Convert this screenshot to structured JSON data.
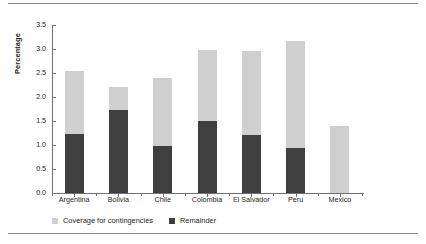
{
  "chart_data": {
    "type": "bar",
    "subtype": "stacked",
    "title": "",
    "xlabel": "",
    "ylabel": "Percentage",
    "ylim": [
      0.0,
      3.5
    ],
    "yticks": [
      "0.0",
      "0.5",
      "1.0",
      "1.5",
      "2.0",
      "2.5",
      "3.0",
      "3.5"
    ],
    "ytick_values": [
      0.0,
      0.5,
      1.0,
      1.5,
      2.0,
      2.5,
      3.0,
      3.5
    ],
    "grid": false,
    "legend_position": "bottom-left",
    "categories": [
      "Argentina",
      "Bolivia",
      "Chile",
      "Colombia",
      "El Salvador",
      "Peru",
      "Mexico"
    ],
    "series": [
      {
        "name": "Remainder",
        "color": "#3f3f3f",
        "values": [
          1.23,
          1.72,
          0.97,
          1.51,
          1.21,
          0.93,
          0.0
        ]
      },
      {
        "name": "Coverage for contingencies",
        "color": "#cfcfcf",
        "values": [
          1.32,
          0.48,
          1.43,
          1.47,
          1.75,
          2.23,
          1.4
        ]
      }
    ],
    "totals": [
      2.55,
      2.2,
      2.4,
      2.98,
      2.96,
      3.16,
      1.4
    ],
    "legend": [
      {
        "label": "Coverage for contingencies",
        "color": "#cfcfcf",
        "swatch": "light"
      },
      {
        "label": "Remainder",
        "color": "#3f3f3f",
        "swatch": "dark"
      }
    ]
  },
  "style": {
    "axis_color": "#6f6f72",
    "rule_color": "#8a8a8d",
    "text_color": "#231f20",
    "background": "#ffffff"
  }
}
